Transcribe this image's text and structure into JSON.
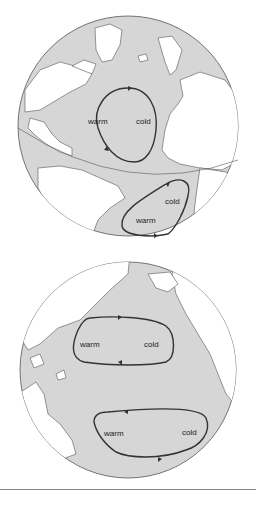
{
  "colors": {
    "ocean": "#d6d6d6",
    "land": "#ffffff",
    "outline": "#555555",
    "gyre": "#333333",
    "background": "#ffffff"
  },
  "atlantic": {
    "gyres": [
      {
        "name": "north-atlantic",
        "warm_label": "warm",
        "cold_label": "cold"
      },
      {
        "name": "south-atlantic",
        "warm_label": "warm",
        "cold_label": "cold"
      }
    ]
  },
  "pacific": {
    "gyres": [
      {
        "name": "north-pacific",
        "warm_label": "warm",
        "cold_label": "cold"
      },
      {
        "name": "south-pacific",
        "warm_label": "warm",
        "cold_label": "cold"
      }
    ]
  }
}
